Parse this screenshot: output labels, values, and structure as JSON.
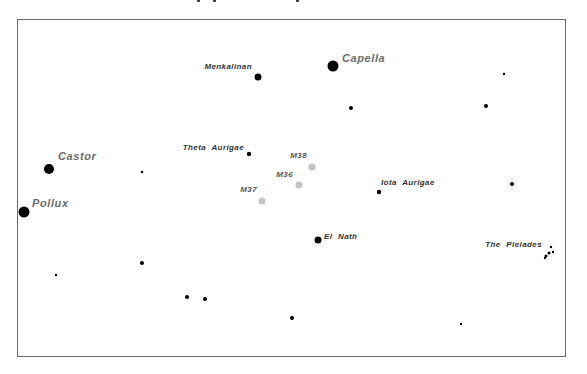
{
  "chart_data": {
    "type": "scatter",
    "frame": {
      "x": 17,
      "y": 19,
      "width": 549,
      "height": 338
    },
    "labeled_objects": [
      {
        "name": "Capella",
        "x": 333,
        "y": 66,
        "r": 5.5,
        "kind": "star",
        "label_color": "#6b6b6b",
        "label_size": 11
      },
      {
        "name": "Menkalinan",
        "x": 258,
        "y": 77,
        "r": 3.5,
        "kind": "star",
        "label_color": "#333333",
        "label_size": 8
      },
      {
        "name": "Castor",
        "x": 49,
        "y": 169,
        "r": 5,
        "kind": "star",
        "label_color": "#6b6b6b",
        "label_size": 11
      },
      {
        "name": "Pollux",
        "x": 24,
        "y": 212,
        "r": 5.5,
        "kind": "star",
        "label_color": "#6b6b6b",
        "label_size": 11
      },
      {
        "name": "Theta Aurigae",
        "x": 249,
        "y": 154,
        "r": 2.2,
        "kind": "star",
        "label_color": "#333333",
        "label_size": 8
      },
      {
        "name": "Iota Aurigae",
        "x": 379,
        "y": 192,
        "r": 2.2,
        "kind": "star",
        "label_color": "#333333",
        "label_size": 8
      },
      {
        "name": "El Nath",
        "x": 318,
        "y": 240,
        "r": 3.5,
        "kind": "star",
        "label_color": "#333333",
        "label_size": 8
      },
      {
        "name": "M38",
        "x": 312,
        "y": 167,
        "r": 3.5,
        "kind": "cluster",
        "label_color": "#555555",
        "label_size": 8
      },
      {
        "name": "M36",
        "x": 299,
        "y": 185,
        "r": 3.5,
        "kind": "cluster",
        "label_color": "#555555",
        "label_size": 8
      },
      {
        "name": "M37",
        "x": 262,
        "y": 201,
        "r": 3.5,
        "kind": "cluster",
        "label_color": "#555555",
        "label_size": 8
      },
      {
        "name": "The Pleiades",
        "x": 548,
        "y": 252,
        "r": 1.5,
        "kind": "cluster",
        "label_color": "#333333",
        "label_size": 8
      }
    ],
    "unlabeled_stars": [
      {
        "x": 504,
        "y": 74,
        "r": 1.2
      },
      {
        "x": 351,
        "y": 108,
        "r": 2
      },
      {
        "x": 486,
        "y": 106,
        "r": 2
      },
      {
        "x": 142,
        "y": 172,
        "r": 1.2
      },
      {
        "x": 512,
        "y": 184,
        "r": 2
      },
      {
        "x": 56,
        "y": 275,
        "r": 1.2
      },
      {
        "x": 142,
        "y": 263,
        "r": 2
      },
      {
        "x": 187,
        "y": 297,
        "r": 2
      },
      {
        "x": 205,
        "y": 299,
        "r": 2
      },
      {
        "x": 292,
        "y": 318,
        "r": 2
      },
      {
        "x": 461,
        "y": 324,
        "r": 1.2
      }
    ],
    "pleiades_dots": [
      {
        "x": 551,
        "y": 247,
        "r": 1.2
      },
      {
        "x": 553,
        "y": 252,
        "r": 1.2
      },
      {
        "x": 549,
        "y": 253,
        "r": 1.5
      },
      {
        "x": 546,
        "y": 256,
        "r": 1.5
      },
      {
        "x": 545,
        "y": 258,
        "r": 1.2
      }
    ],
    "colors": {
      "star": "#000000",
      "cluster": "#c4c4c4",
      "frame": "#6a6a6a"
    },
    "grid": false,
    "legend": null
  }
}
